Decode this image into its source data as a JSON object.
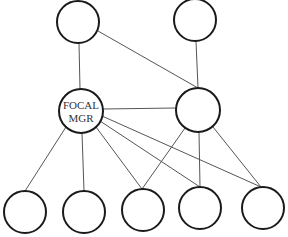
{
  "diagram": {
    "type": "org-network",
    "colors": {
      "node_stroke": "#1a1a1a",
      "edge_stroke": "#555555",
      "label": "#333333",
      "background": "#ffffff"
    },
    "nodes": [
      {
        "id": "top_left",
        "cx": 78,
        "cy": 22,
        "r": 21,
        "label_lines": []
      },
      {
        "id": "top_right",
        "cx": 195,
        "cy": 20,
        "r": 21,
        "label_lines": []
      },
      {
        "id": "focal_mgr",
        "cx": 81,
        "cy": 111,
        "r": 22,
        "label_lines": [
          "FOCAL",
          "MGR"
        ]
      },
      {
        "id": "mid_right",
        "cx": 198,
        "cy": 110,
        "r": 22,
        "label_lines": []
      },
      {
        "id": "bottom_1",
        "cx": 25,
        "cy": 212,
        "r": 21,
        "label_lines": []
      },
      {
        "id": "bottom_2",
        "cx": 84,
        "cy": 212,
        "r": 21,
        "label_lines": []
      },
      {
        "id": "bottom_3",
        "cx": 143,
        "cy": 210,
        "r": 21,
        "label_lines": []
      },
      {
        "id": "bottom_4",
        "cx": 200,
        "cy": 208,
        "r": 21,
        "label_lines": []
      },
      {
        "id": "bottom_5",
        "cx": 263,
        "cy": 208,
        "r": 21,
        "label_lines": []
      }
    ],
    "edges": [
      {
        "from": "top_left",
        "to": "focal_mgr",
        "x1": 79,
        "y1": 43,
        "x2": 80,
        "y2": 89
      },
      {
        "from": "top_left",
        "to": "mid_right",
        "x1": 98,
        "y1": 31,
        "x2": 198,
        "y2": 88
      },
      {
        "from": "top_right",
        "to": "mid_right",
        "x1": 196,
        "y1": 41,
        "x2": 198,
        "y2": 88
      },
      {
        "from": "focal_mgr",
        "to": "mid_right",
        "x1": 103,
        "y1": 109,
        "x2": 176,
        "y2": 108
      },
      {
        "from": "focal_mgr",
        "to": "bottom_1",
        "x1": 66,
        "y1": 127,
        "x2": 25,
        "y2": 191
      },
      {
        "from": "focal_mgr",
        "to": "bottom_2",
        "x1": 82,
        "y1": 133,
        "x2": 84,
        "y2": 191
      },
      {
        "from": "focal_mgr",
        "to": "bottom_3",
        "x1": 96,
        "y1": 127,
        "x2": 142,
        "y2": 189
      },
      {
        "from": "focal_mgr",
        "to": "bottom_4",
        "x1": 100,
        "y1": 121,
        "x2": 200,
        "y2": 187
      },
      {
        "from": "focal_mgr",
        "to": "bottom_5",
        "x1": 102,
        "y1": 116,
        "x2": 261,
        "y2": 187
      },
      {
        "from": "mid_right",
        "to": "bottom_3",
        "x1": 185,
        "y1": 128,
        "x2": 142,
        "y2": 189
      },
      {
        "from": "mid_right",
        "to": "bottom_4",
        "x1": 199,
        "y1": 132,
        "x2": 200,
        "y2": 187
      },
      {
        "from": "mid_right",
        "to": "bottom_5",
        "x1": 213,
        "y1": 127,
        "x2": 261,
        "y2": 187
      }
    ]
  }
}
